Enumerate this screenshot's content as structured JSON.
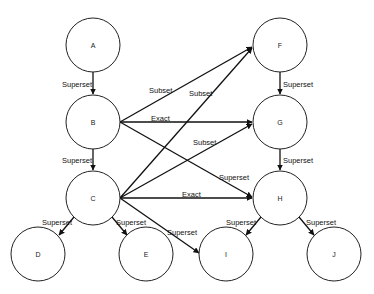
{
  "diagram": {
    "nodes": [
      {
        "id": "A",
        "label": "A",
        "x": 93,
        "y": 45
      },
      {
        "id": "B",
        "label": "B",
        "x": 93,
        "y": 122
      },
      {
        "id": "C",
        "label": "C",
        "x": 93,
        "y": 198
      },
      {
        "id": "D",
        "label": "D",
        "x": 38,
        "y": 254
      },
      {
        "id": "E",
        "label": "E",
        "x": 146,
        "y": 254
      },
      {
        "id": "F",
        "label": "F",
        "x": 280,
        "y": 45
      },
      {
        "id": "G",
        "label": "G",
        "x": 280,
        "y": 122
      },
      {
        "id": "H",
        "label": "H",
        "x": 280,
        "y": 198
      },
      {
        "id": "I",
        "label": "I",
        "x": 226,
        "y": 254
      },
      {
        "id": "J",
        "label": "J",
        "x": 334,
        "y": 254
      }
    ],
    "edges": [
      {
        "from": "A",
        "to": "B",
        "label": "Superset"
      },
      {
        "from": "B",
        "to": "C",
        "label": "Superset"
      },
      {
        "from": "C",
        "to": "D",
        "label": "Superset"
      },
      {
        "from": "C",
        "to": "E",
        "label": "Superset"
      },
      {
        "from": "F",
        "to": "G",
        "label": "Superset"
      },
      {
        "from": "G",
        "to": "H",
        "label": "Superset"
      },
      {
        "from": "H",
        "to": "I",
        "label": "Superset"
      },
      {
        "from": "H",
        "to": "J",
        "label": "Superset"
      },
      {
        "from": "B",
        "to": "F",
        "label": "Subset"
      },
      {
        "from": "B",
        "to": "G",
        "label": "Exact"
      },
      {
        "from": "B",
        "to": "H",
        "label": "Superset"
      },
      {
        "from": "C",
        "to": "F",
        "label": "Subset"
      },
      {
        "from": "C",
        "to": "G",
        "label": "Subset"
      },
      {
        "from": "C",
        "to": "H",
        "label": "Exact"
      },
      {
        "from": "C",
        "to": "I",
        "label": "Superset"
      }
    ]
  }
}
